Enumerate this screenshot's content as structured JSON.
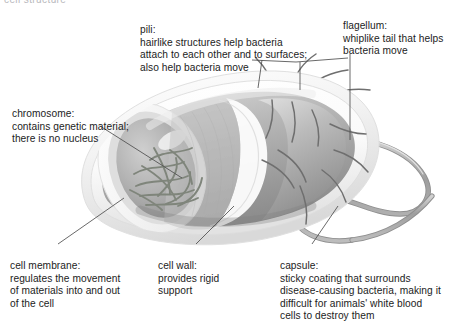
{
  "figure": {
    "clipped_top_text": "cell structure",
    "colors": {
      "text": "#1c1c1c",
      "leader_line": "#5a5a5a",
      "capsule_light": "#efefef",
      "cell_wall": "#fbfbfb",
      "cytoplasm_mid": "#a9a9a9",
      "cytoplasm_dark": "#8d8d8d",
      "chromosome": "#7c8478",
      "flagellum": "#a6a6a6",
      "pili": "#6e6e6e"
    }
  },
  "labels": {
    "pili": {
      "term": "pili:",
      "description": "hairlike structures help bacteria\nattach to each other and to surfaces;\nalso help bacteria move"
    },
    "flagellum": {
      "term": "flagellum:",
      "description": "whiplike tail that helps\nbacteria move"
    },
    "chromosome": {
      "term": "chromosome:",
      "description": "contains genetic material;\nthere is no nucleus"
    },
    "cell_membrane": {
      "term": "cell membrane:",
      "description": "regulates the movement\nof materials into and out\nof the cell"
    },
    "cell_wall": {
      "term": "cell wall:",
      "description": "provides rigid\nsupport"
    },
    "capsule": {
      "term": "capsule:",
      "description": "sticky coating that surrounds\ndisease-causing bacteria, making it\ndifficult for animals' white blood\ncells to destroy them"
    }
  }
}
